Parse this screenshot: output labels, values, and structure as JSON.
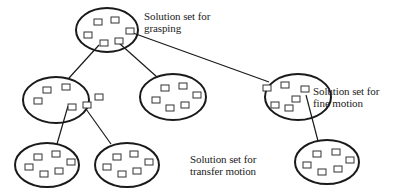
{
  "diagram": {
    "labels": {
      "grasping": [
        "Solution set for",
        "grasping"
      ],
      "fine_motion": [
        "Solution set for",
        "fine motion"
      ],
      "transfer_motion": [
        "Solution set for",
        "transfer motion"
      ]
    },
    "colors": {
      "stroke": "#1a1a1a",
      "text": "#222222",
      "background": "#ffffff"
    },
    "nodes": [
      {
        "id": "grasping",
        "cx": 107,
        "cy": 30,
        "rx": 31,
        "ry": 22
      },
      {
        "id": "mid-left",
        "cx": 56,
        "cy": 100,
        "rx": 33,
        "ry": 23
      },
      {
        "id": "mid-center",
        "cx": 173,
        "cy": 97,
        "rx": 33,
        "ry": 23
      },
      {
        "id": "fine-motion",
        "cx": 298,
        "cy": 97,
        "rx": 33,
        "ry": 23
      },
      {
        "id": "bottom-left-1",
        "cx": 47,
        "cy": 165,
        "rx": 32,
        "ry": 22
      },
      {
        "id": "bottom-left-2",
        "cx": 127,
        "cy": 165,
        "rx": 32,
        "ry": 22
      },
      {
        "id": "bottom-right",
        "cx": 327,
        "cy": 162,
        "rx": 32,
        "ry": 22
      }
    ],
    "edges": [
      {
        "from": "grasping",
        "to": "mid-left"
      },
      {
        "from": "grasping",
        "to": "mid-center"
      },
      {
        "from": "grasping",
        "to": "fine-motion"
      },
      {
        "from": "mid-left",
        "to": "bottom-left-1"
      },
      {
        "from": "mid-left",
        "to": "bottom-left-2"
      },
      {
        "from": "fine-motion",
        "to": "bottom-right"
      }
    ]
  }
}
